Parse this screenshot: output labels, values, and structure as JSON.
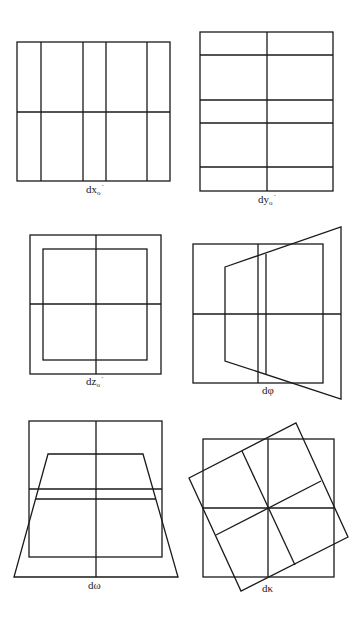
{
  "figure": {
    "panels": [
      {
        "id": "dx",
        "label": "dx",
        "sub": "o",
        "sup": "´",
        "description": "Grid shifted in x: vertical lines unevenly spaced"
      },
      {
        "id": "dy",
        "label": "dy",
        "sub": "o",
        "sup": "´",
        "description": "Grid shifted in y: horizontal lines unevenly spaced"
      },
      {
        "id": "dz",
        "label": "dz",
        "sub": "o",
        "sup": "´",
        "description": "Scale change: inner square within outer square"
      },
      {
        "id": "dphi",
        "label": "dφ",
        "sub": "",
        "sup": "",
        "description": "Rotation about y-axis: trapezoid widening to the right"
      },
      {
        "id": "domega",
        "label": "dω",
        "sub": "",
        "sup": "",
        "description": "Rotation about x-axis: trapezoid widening downward"
      },
      {
        "id": "dkappa",
        "label": "dκ",
        "sub": "",
        "sup": "",
        "description": "Rotation about z-axis: rotated square overlay"
      }
    ]
  }
}
